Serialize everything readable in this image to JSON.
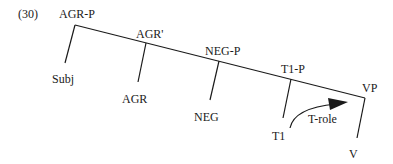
{
  "example_number": "(30)",
  "tree": {
    "root": "AGR-P",
    "nodes": {
      "agr_bar": "AGR'",
      "neg_p": "NEG-P",
      "t1_p": "T1-P",
      "vp": "VP"
    },
    "leaves": {
      "subj": "Subj",
      "agr": "AGR",
      "neg": "NEG",
      "t1": "T1",
      "v": "V"
    },
    "arrow_label": "T-role"
  },
  "colors": {
    "line": "#1a1a1a",
    "background": "#ffffff"
  }
}
